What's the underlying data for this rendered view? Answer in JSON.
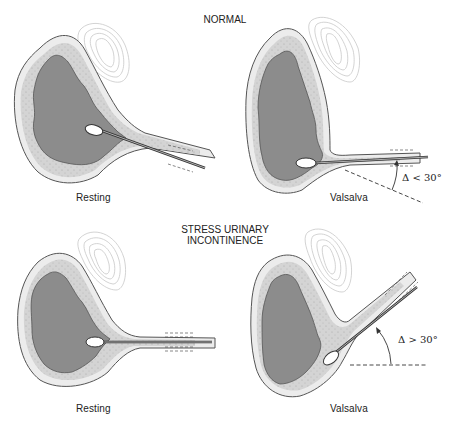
{
  "figure": {
    "sections": [
      {
        "title": "NORMAL",
        "panels": [
          {
            "label": "Resting"
          },
          {
            "label": "Valsalva",
            "angle_annotation": "Δ < 30°"
          }
        ]
      },
      {
        "title_line1": "STRESS URINARY",
        "title_line2": "INCONTINENCE",
        "panels": [
          {
            "label": "Resting"
          },
          {
            "label": "Valsalva",
            "angle_annotation": "Δ > 30°"
          }
        ]
      }
    ],
    "colors": {
      "lumen": "#8c8c8c",
      "wall": "#d2d2d2",
      "outer_rim": "#ececec",
      "outline": "#555555",
      "pubic_bone": "#c8c8c8",
      "catheter": "#333333",
      "balloon": "#ffffff"
    }
  }
}
